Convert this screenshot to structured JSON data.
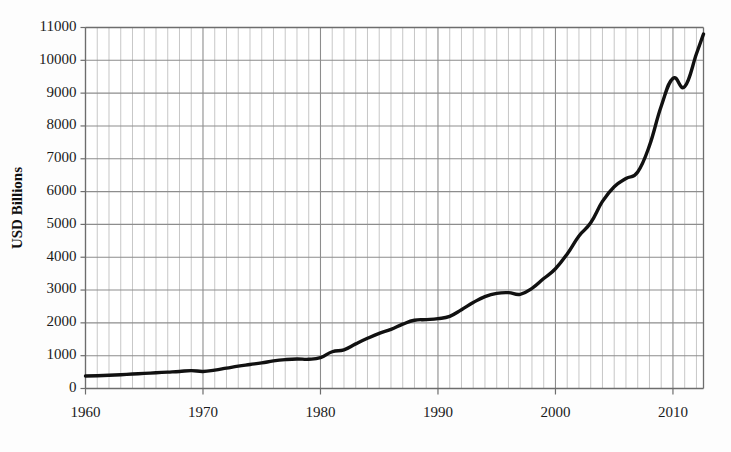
{
  "chart_data": {
    "type": "line",
    "title": "",
    "subtitle": "",
    "xlabel": "",
    "ylabel": "USD Billions",
    "xlim": [
      1960,
      2012.6
    ],
    "ylim": [
      0,
      11000
    ],
    "grid": true,
    "legend_position": "none",
    "x_major_ticks": [
      1960,
      1970,
      1980,
      1990,
      2000,
      2010
    ],
    "x_major_tick_labels": [
      "1960",
      "1970",
      "1980",
      "1990",
      "2000",
      "2010"
    ],
    "x_minor_tick_step": 1,
    "y_ticks": [
      0,
      1000,
      2000,
      3000,
      4000,
      5000,
      6000,
      7000,
      8000,
      9000,
      10000,
      11000
    ],
    "y_tick_labels": [
      "0",
      "1000",
      "2000",
      "3000",
      "4000",
      "5000",
      "6000",
      "7000",
      "8000",
      "9000",
      "10000",
      "11000"
    ],
    "series": [
      {
        "name": "USD Billions",
        "color": "#111111",
        "x": [
          1960,
          1961,
          1962,
          1963,
          1964,
          1965,
          1966,
          1967,
          1968,
          1969,
          1970,
          1971,
          1972,
          1973,
          1974,
          1975,
          1976,
          1977,
          1978,
          1979,
          1980,
          1981,
          1982,
          1983,
          1984,
          1985,
          1986,
          1987,
          1988,
          1989,
          1990,
          1991,
          1992,
          1993,
          1994,
          1995,
          1996,
          1997,
          1998,
          1999,
          2000,
          2001,
          2002,
          2003,
          2004,
          2005,
          2006,
          2007,
          2008,
          2009,
          2010,
          2011,
          2012,
          2012.6
        ],
        "values": [
          380,
          390,
          405,
          420,
          440,
          460,
          480,
          500,
          520,
          545,
          520,
          560,
          620,
          680,
          730,
          780,
          840,
          880,
          900,
          890,
          940,
          1120,
          1180,
          1360,
          1530,
          1680,
          1800,
          1960,
          2080,
          2100,
          2130,
          2200,
          2400,
          2620,
          2800,
          2900,
          2920,
          2870,
          3050,
          3350,
          3650,
          4100,
          4650,
          5050,
          5700,
          6150,
          6400,
          6600,
          7400,
          8600,
          9450,
          9200,
          10200,
          10800
        ]
      }
    ],
    "colors": {
      "line": "#111111",
      "grid_minor": "#b9b9b9",
      "grid_major": "#8d8d8d",
      "axis": "#6d6d6d",
      "background": "#fdfdfd",
      "plot_background": "#ffffff",
      "text": "#1a1a1a"
    }
  },
  "labels": {
    "y_axis_title": "USD Billions"
  }
}
